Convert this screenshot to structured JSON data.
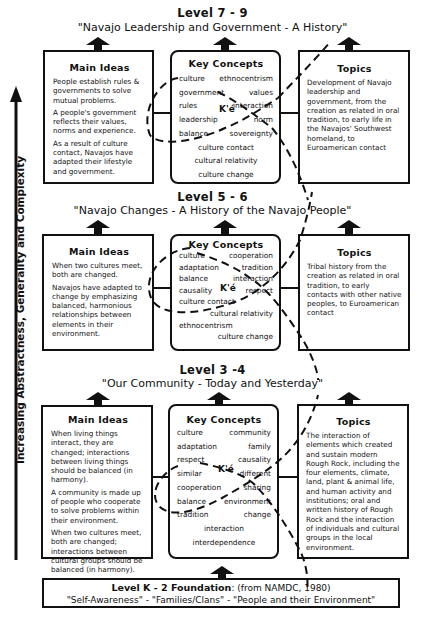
{
  "side_axis": {
    "label": "Increasing Abstractness, Generality and Complexity"
  },
  "levels": [
    {
      "title": "Level 7 - 9",
      "subtitle": "\"Navajo Leadership and Government - A History\"",
      "main_ideas": {
        "heading": "Main Ideas",
        "paragraphs": [
          "People establish rules & governments to solve mutual problems.",
          "A people's government reflects their values, norms and experience.",
          "As a result of culture contact, Navajos have adapted their lifestyle and government."
        ]
      },
      "key_concepts": {
        "heading": "Key Concepts",
        "center_term": "K'é",
        "rows": [
          [
            "culture",
            "ethnocentrism"
          ],
          [
            "government",
            "values"
          ],
          [
            "rules",
            "interaction"
          ],
          [
            "leadership",
            "norm"
          ],
          [
            "balance",
            "sovereignty"
          ]
        ],
        "centered": [
          "culture contact",
          "cultural relativity",
          "culture change"
        ]
      },
      "topics": {
        "heading": "Topics",
        "text": "Development of Navajo leadership and government, from the creation as related in oral tradition, to early life in the Navajos' Southwest homeland, to Euroamerican contact"
      }
    },
    {
      "title": "Level 5 - 6",
      "subtitle": "\"Navajo Changes - A History of the Navajo People\"",
      "main_ideas": {
        "heading": "Main Ideas",
        "paragraphs": [
          "When two cultures meet, both are changed.",
          "Navajos have adapted to change by emphasizing balanced, harmonious relationships between elements in their environment."
        ]
      },
      "key_concepts": {
        "heading": "Key Concepts",
        "center_term": "K'é",
        "rows": [
          [
            "culture",
            "cooperation"
          ],
          [
            "adaptation",
            "tradition"
          ],
          [
            "balance",
            "interaction"
          ],
          [
            "causality",
            "respect"
          ]
        ],
        "left_item": "culture contact",
        "right_item": "cultural relativity",
        "left_item2": "ethnocentrism",
        "right_item2": "culture change"
      },
      "topics": {
        "heading": "Topics",
        "text": "Tribal history from the creation as related in oral tradition, to early contacts with other native peoples, to Euroamerican contact"
      }
    },
    {
      "title": "Level 3 -4",
      "subtitle": "\"Our Community - Today and Yesterday\"",
      "main_ideas": {
        "heading": "Main Ideas",
        "paragraphs": [
          "When living things interact, they are changed; interactions between living things should be balanced (in harmony).",
          "A community is made up of people who cooperate to solve problems within their environment.",
          "When two cultures meet, both are changed; interactions between cultural groups should be balanced (in harmony)."
        ]
      },
      "key_concepts": {
        "heading": "Key Concepts",
        "center_term": "K'é",
        "rows": [
          [
            "culture",
            "community"
          ],
          [
            "adaptation",
            "family"
          ],
          [
            "respect",
            "causality"
          ],
          [
            "similar",
            "different"
          ],
          [
            "cooperation",
            "sharing"
          ],
          [
            "balance",
            "environment"
          ],
          [
            "tradition",
            "change"
          ]
        ],
        "centered": [
          "interaction",
          "interdependence"
        ]
      },
      "topics": {
        "heading": "Topics",
        "text": "The interaction of elements which created and sustain modern Rough Rock, including the four elements, climate, land, plant & animal life, and human activity and institutions; oral and written history of Rough Rock and the interaction of individuals and cultural groups in the local environment."
      }
    }
  ],
  "foundation": {
    "title": "Level K - 2 Foundation",
    "source": ": (from NAMDC, 1980)",
    "themes": "\"Self-Awareness\" - \"Families/Clans\" - \"People and their Environment\""
  }
}
